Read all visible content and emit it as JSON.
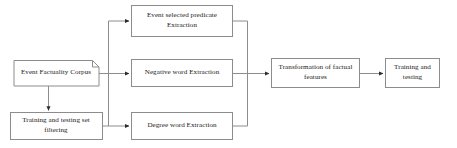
{
  "diagram": {
    "type": "flowchart",
    "title": "",
    "nodes": [
      {
        "id": "corpus",
        "label": "Event Factuality Corpus",
        "shape": "document",
        "x": 14,
        "y": 60,
        "w": 85,
        "h": 26
      },
      {
        "id": "filter",
        "label": "Training and testing set filtering",
        "shape": "rectangle",
        "x": 10,
        "y": 112,
        "w": 92,
        "h": 28
      },
      {
        "id": "predicate",
        "label": "Event selected predicate Extraction",
        "shape": "rectangle",
        "x": 131,
        "y": 5,
        "w": 102,
        "h": 32
      },
      {
        "id": "negative",
        "label": "Negative word Extraction",
        "shape": "rectangle",
        "x": 131,
        "y": 59,
        "w": 102,
        "h": 28
      },
      {
        "id": "degree",
        "label": "Degree word Extraction",
        "shape": "rectangle",
        "x": 131,
        "y": 112,
        "w": 102,
        "h": 28
      },
      {
        "id": "transform",
        "label": "Transformation of factual features",
        "shape": "rectangle",
        "x": 271,
        "y": 58,
        "w": 89,
        "h": 30
      },
      {
        "id": "traintest",
        "label": "Training and testing",
        "shape": "rectangle",
        "x": 385,
        "y": 58,
        "w": 55,
        "h": 30
      }
    ],
    "edges": [
      {
        "from": "corpus",
        "to": "filter",
        "style": "straight-down-arrow"
      },
      {
        "from": "corpus",
        "to": "predicate",
        "style": "orthogonal-branch-arrow"
      },
      {
        "from": "filter",
        "to": "negative",
        "style": "orthogonal-branch-arrow"
      },
      {
        "from": "filter",
        "to": "degree",
        "style": "orthogonal-branch-arrow"
      },
      {
        "from": "predicate",
        "to": "transform",
        "style": "orthogonal-merge"
      },
      {
        "from": "negative",
        "to": "transform",
        "style": "orthogonal-merge-arrow"
      },
      {
        "from": "degree",
        "to": "transform",
        "style": "orthogonal-merge"
      },
      {
        "from": "transform",
        "to": "traintest",
        "style": "straight-right-arrow"
      }
    ],
    "colors": {
      "node_stroke": "#8c8c8c",
      "node_fill": "#ffffff",
      "connector_stroke": "#8c8c8c",
      "arrowhead": "#2b2b2b",
      "text": "#1a1a1a",
      "background": "#ffffff"
    }
  }
}
